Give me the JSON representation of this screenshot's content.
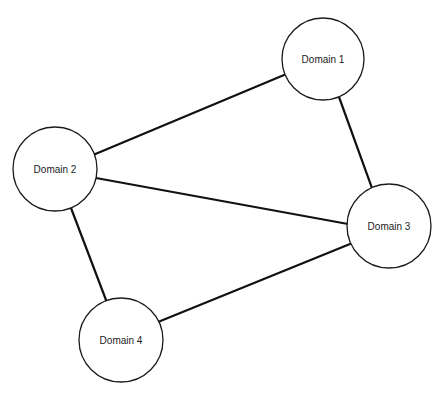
{
  "diagram": {
    "type": "network-graph",
    "width": 443,
    "height": 398,
    "colors": {
      "background": "#ffffff",
      "edge": "#111111",
      "node_stroke": "#1a1a1a",
      "node_fill": "#ffffff",
      "label": "#222222"
    },
    "nodes": [
      {
        "id": "d1",
        "label": "Domain 1",
        "cx": 323,
        "cy": 59,
        "r": 41
      },
      {
        "id": "d2",
        "label": "Domain 2",
        "cx": 55,
        "cy": 169,
        "r": 42
      },
      {
        "id": "d3",
        "label": "Domain 3",
        "cx": 389,
        "cy": 226,
        "r": 42
      },
      {
        "id": "d4",
        "label": "Domain 4",
        "cx": 121,
        "cy": 340,
        "r": 42
      }
    ],
    "edges": [
      {
        "from": "d2",
        "to": "d1",
        "x1": 93,
        "y1": 155,
        "x2": 284,
        "y2": 75
      },
      {
        "from": "d1",
        "to": "d3",
        "x1": 339,
        "y1": 97,
        "x2": 372,
        "y2": 188
      },
      {
        "from": "d2",
        "to": "d3",
        "x1": 96,
        "y1": 178,
        "x2": 348,
        "y2": 224
      },
      {
        "from": "d2",
        "to": "d4",
        "x1": 71,
        "y1": 208,
        "x2": 106,
        "y2": 300
      },
      {
        "from": "d3",
        "to": "d4",
        "x1": 350,
        "y1": 244,
        "x2": 158,
        "y2": 322
      }
    ]
  }
}
